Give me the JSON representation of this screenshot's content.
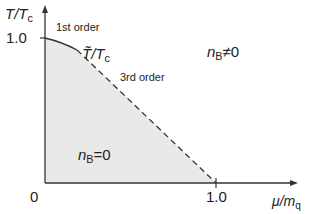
{
  "diagram": {
    "type": "phase-diagram",
    "y_axis": {
      "label_main": "T/T",
      "label_sub": "c",
      "tick_label": "1.0"
    },
    "x_axis": {
      "label_main": "μ/m",
      "label_sub": "q",
      "tick_label": "1.0",
      "origin_label": "0"
    },
    "annotations": {
      "first_order": "1st order",
      "third_order": "3rd order",
      "curve_label_main": "T̃/T",
      "curve_label_sub": "c",
      "region_outside": {
        "main": "n",
        "sub": "B",
        "rel": "≠0"
      },
      "region_inside": {
        "main": "n",
        "sub": "B",
        "rel": "=0"
      }
    },
    "colors": {
      "fill": "#e9e9e9",
      "line": "#333333"
    }
  }
}
